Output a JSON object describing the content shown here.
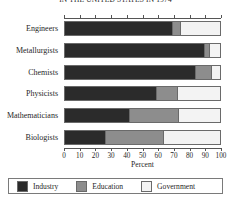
{
  "chart_data": {
    "type": "bar",
    "orientation": "horizontal",
    "stacked": true,
    "title": "IN THE UNITED STATES IN 1974",
    "xlabel": "Percent",
    "ylabel": "",
    "xlim": [
      0,
      100
    ],
    "xticks": [
      0,
      10,
      20,
      30,
      40,
      50,
      60,
      70,
      80,
      90,
      100
    ],
    "xticklabels": [
      "0",
      "10",
      "20",
      "30",
      "40",
      "50",
      "60",
      "70",
      "80",
      "90",
      "100"
    ],
    "grid": false,
    "legend_position": "bottom",
    "categories": [
      "Engineers",
      "Metallurgists",
      "Chemists",
      "Physicists",
      "Mathematicians",
      "Biologists"
    ],
    "series": [
      {
        "name": "Industry",
        "color": "#2b2b2b",
        "values": [
          69,
          90,
          84,
          59,
          41,
          26
        ]
      },
      {
        "name": "Education",
        "color": "#8d8d8d",
        "values": [
          5,
          3,
          10,
          13,
          32,
          37
        ]
      },
      {
        "name": "Government",
        "color": "#f3f3f3",
        "values": [
          26,
          7,
          6,
          28,
          27,
          37
        ]
      }
    ]
  },
  "legend": {
    "items": [
      {
        "label": "Industry",
        "color": "#2b2b2b"
      },
      {
        "label": "Education",
        "color": "#8d8d8d"
      },
      {
        "label": "Government",
        "color": "#f3f3f3"
      }
    ]
  }
}
